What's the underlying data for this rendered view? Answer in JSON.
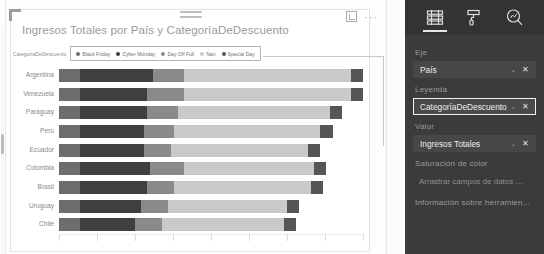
{
  "visual": {
    "title": "Ingresos Totales por País y CategoríaDeDescuento",
    "focus_icon": "focus-mode-icon",
    "more_icon": "more-options-icon",
    "more_label": "···"
  },
  "legend": {
    "title": "CategoríaDeDescuento",
    "items": [
      {
        "label": "Black Friday",
        "color": "#6d6d6d"
      },
      {
        "label": "Cyber Monday",
        "color": "#3f3f3f"
      },
      {
        "label": "Day Off Full",
        "color": "#8a8a8a"
      },
      {
        "label": "Nan",
        "color": "#c9c9c9"
      },
      {
        "label": "Special Day",
        "color": "#555555"
      }
    ]
  },
  "chart_data": {
    "type": "bar",
    "orientation": "horizontal",
    "stacked": true,
    "title": "Ingresos Totales por País y CategoríaDeDescuento",
    "xlabel": "",
    "ylabel": "País",
    "legend_title": "CategoríaDeDescuento",
    "legend_position": "top",
    "grid": true,
    "categories": [
      "Argentina",
      "Venezuela",
      "Paraguay",
      "Perú",
      "Ecuador",
      "Colombia",
      "Brasil",
      "Uruguay",
      "Chile"
    ],
    "series": [
      {
        "name": "Black Friday",
        "color": "#6d6d6d",
        "values": [
          7,
          7,
          7,
          7,
          7,
          7,
          7,
          7,
          7
        ]
      },
      {
        "name": "Cyber Monday",
        "color": "#3f3f3f",
        "values": [
          24,
          22,
          22,
          21,
          21,
          23,
          22,
          20,
          18
        ]
      },
      {
        "name": "Day Off Full",
        "color": "#8a8a8a",
        "values": [
          10,
          12,
          10,
          10,
          9,
          11,
          9,
          9,
          9
        ]
      },
      {
        "name": "Nan",
        "color": "#c9c9c9",
        "values": [
          55,
          55,
          50,
          48,
          45,
          43,
          45,
          39,
          40
        ]
      },
      {
        "name": "Special Day",
        "color": "#555555",
        "values": [
          4,
          4,
          4,
          4,
          4,
          4,
          4,
          4,
          4
        ]
      }
    ],
    "xlim": [
      0,
      100
    ],
    "gridline_positions": [
      0,
      12.5,
      25,
      37.5,
      50,
      62.5,
      75,
      87.5,
      100
    ]
  },
  "panel": {
    "tabs": [
      {
        "name": "fields-tab",
        "icon": "fields-icon",
        "selected": true
      },
      {
        "name": "format-tab",
        "icon": "paint-roller-icon",
        "selected": false
      },
      {
        "name": "analytics-tab",
        "icon": "analytics-magnifier-icon",
        "selected": false
      }
    ],
    "wells": [
      {
        "label": "Eje",
        "field": "País",
        "selected": false,
        "caret": "⌄",
        "close": "✕"
      },
      {
        "label": "Leyenda",
        "field": "CategoríaDeDescuento",
        "selected": true,
        "caret": "⌄",
        "close": "✕"
      },
      {
        "label": "Valor",
        "field": "Ingresos Totales",
        "selected": false,
        "caret": "⌄",
        "close": "✕"
      }
    ],
    "empty_wells": [
      {
        "label": "Saturación de color",
        "placeholder": "Arrastrar campos de datos ..."
      },
      {
        "label": "Información sobre herramien...",
        "placeholder": ""
      }
    ]
  }
}
